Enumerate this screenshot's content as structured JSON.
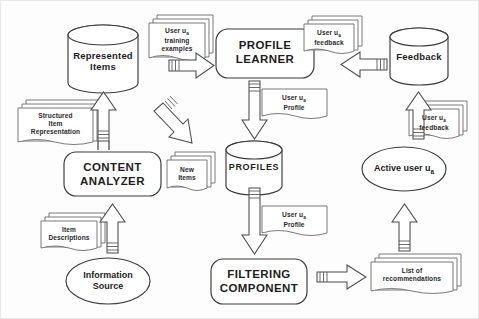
{
  "diagram": {
    "type": "flow-diagram",
    "style": {
      "stroke": "#3a3a3a",
      "fill": "#ffffff",
      "background": "#fdfdfd",
      "text": "#1d1d1d"
    },
    "nodes": {
      "represented_items": {
        "label": "Represented\nItems",
        "shape": "cylinder"
      },
      "profile_learner": {
        "label": "PROFILE\nLEARNER",
        "shape": "rounded-rect"
      },
      "feedback_store": {
        "label": "Feedback",
        "shape": "cylinder"
      },
      "content_analyzer": {
        "label": "CONTENT\nANALYZER",
        "shape": "rounded-rect"
      },
      "profiles": {
        "label": "PROFILES",
        "shape": "cylinder"
      },
      "active_user": {
        "label": "Active user u",
        "label_sub": "a",
        "shape": "ellipse"
      },
      "information_source": {
        "label": "Information\nSource",
        "shape": "ellipse"
      },
      "filtering_component": {
        "label": "FILTERING\nCOMPONENT",
        "shape": "rounded-rect"
      }
    },
    "documents": {
      "training_examples": {
        "line1": "User u",
        "sub1": "a",
        "line2": "training",
        "line3": "examples",
        "stacked": true
      },
      "feedback_top": {
        "line1": "User u",
        "sub1": "a",
        "line2": "feedback",
        "stacked": true
      },
      "feedback_right": {
        "line1": "User u",
        "sub1": "a",
        "line2": "feedback",
        "stacked": true
      },
      "structured_item_representation": {
        "line1": "Structured",
        "line2": "Item",
        "line3": "Representation",
        "stacked": true
      },
      "user_profile_top": {
        "line1": "User u",
        "sub1": "a",
        "line2": "Profile",
        "stacked": false
      },
      "user_profile_bottom": {
        "line1": "User u",
        "sub1": "a",
        "line2": "Profile",
        "stacked": false
      },
      "new_items": {
        "line1": "New",
        "line2": "Items",
        "stacked": true
      },
      "item_descriptions": {
        "line1": "Item",
        "line2": "Descriptions",
        "stacked": true
      },
      "list_of_recommendations": {
        "line1": "List of",
        "line2": "recommendations",
        "stacked": true
      }
    },
    "arrows": [
      {
        "name": "training-examples-to-profile-learner",
        "direction": "right"
      },
      {
        "name": "feedback-store-to-profile-learner",
        "direction": "left"
      },
      {
        "name": "user-feedback-to-feedback-store",
        "direction": "up"
      },
      {
        "name": "structured-items-to-represented-items",
        "direction": "up"
      },
      {
        "name": "represented-items-to-content-analyzer",
        "direction": "up"
      },
      {
        "name": "content-analyzer-to-profiles",
        "direction": "down-right"
      },
      {
        "name": "profile-learner-to-profiles",
        "direction": "down"
      },
      {
        "name": "item-descriptions-to-content-analyzer",
        "direction": "up"
      },
      {
        "name": "profiles-to-filtering-component",
        "direction": "down"
      },
      {
        "name": "filtering-component-to-recommendations",
        "direction": "right"
      },
      {
        "name": "recommendations-to-active-user",
        "direction": "up"
      }
    ]
  }
}
